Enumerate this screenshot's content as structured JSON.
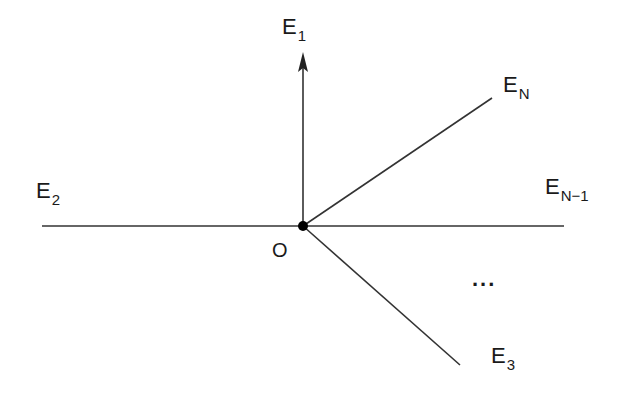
{
  "diagram": {
    "type": "ray-fan",
    "origin": {
      "label": "O",
      "x": 303,
      "y": 226
    },
    "edges": [
      {
        "name": "E",
        "index": "1",
        "end": [
          303,
          52
        ],
        "arrow": true
      },
      {
        "name": "E",
        "index": "2",
        "end": [
          42,
          226
        ],
        "arrow": false
      },
      {
        "name": "E",
        "index": "3",
        "end": [
          460,
          365
        ],
        "arrow": false
      },
      {
        "name": "E",
        "index": "N-1",
        "end": [
          564,
          226
        ],
        "arrow": false
      },
      {
        "name": "E",
        "index": "N",
        "end": [
          492,
          98
        ],
        "arrow": false
      }
    ],
    "labels": {
      "e1": {
        "base": "E",
        "sub": "1"
      },
      "e2": {
        "base": "E",
        "sub": "2"
      },
      "e3": {
        "base": "E",
        "sub": "3"
      },
      "en1": {
        "base": "E",
        "sub": "N−1"
      },
      "en": {
        "base": "E",
        "sub": "N"
      },
      "origin": "O",
      "ellipsis": "..."
    },
    "colors": {
      "stroke": "#333333",
      "text": "#1a1a1a",
      "vertex": "#000000",
      "background": "#ffffff"
    }
  }
}
